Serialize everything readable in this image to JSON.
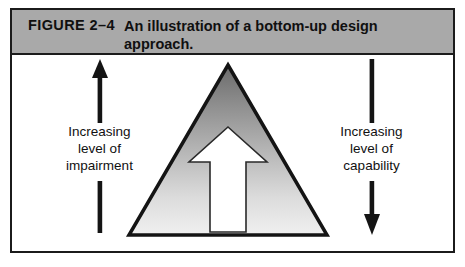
{
  "figure": {
    "label": "FIGURE 2–4",
    "caption": "An illustration of a bottom-up design approach."
  },
  "diagram": {
    "left_axis": {
      "label": "Increasing\nlevel of\nimpairment",
      "arrow_direction": "up",
      "arrow_icon": "arrow-up-icon"
    },
    "right_axis": {
      "label": "Increasing\nlevel of\ncapability",
      "arrow_direction": "down",
      "arrow_icon": "arrow-down-icon"
    },
    "center": {
      "shape": "triangle",
      "inner_icon": "arrow-up-icon",
      "inner_arrow_direction": "up"
    }
  },
  "colors": {
    "caption_bar": "#a9a9a9",
    "frame_border": "#1b1b1b",
    "triangle_outline": "#141414",
    "triangle_gradient_top": "#6f6f6f",
    "triangle_gradient_mid": "#b5b5b5",
    "triangle_gradient_bottom": "#ededed",
    "inner_arrow_fill": "#ffffff",
    "text": "#111111",
    "page_background": "#ffffff"
  }
}
